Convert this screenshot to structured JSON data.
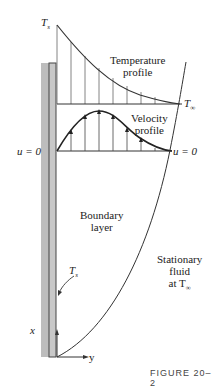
{
  "labels": {
    "ts_top": "T",
    "ts_sub": "s",
    "temperature_profile_1": "Temperature",
    "temperature_profile_2": "profile",
    "t_inf": "T",
    "t_inf_sub": "∞",
    "velocity_profile_1": "Velocity",
    "velocity_profile_2": "profile",
    "u_left": "u = 0",
    "u_right": "u = 0",
    "boundary_1": "Boundary",
    "boundary_2": "layer",
    "stationary_1": "Stationary",
    "stationary_2": "fluid",
    "stationary_3": "at T",
    "stationary_3_sub": "∞",
    "ts_wall": "T",
    "ts_wall_sub": "s",
    "x_axis": "x",
    "y_axis": "y",
    "figure_caption": "FIGURE 20–2"
  },
  "colors": {
    "line": "#333333",
    "wall_gray": "#bdbdbd",
    "wall_plate": "#9a9a9a"
  }
}
